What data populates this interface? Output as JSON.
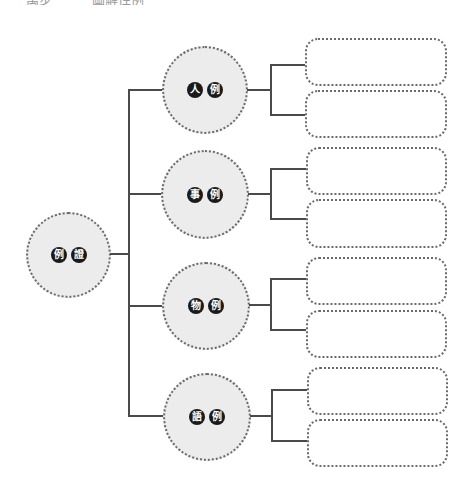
{
  "header": {
    "left_fragment": "萬步",
    "right_fragment": "圖解性例"
  },
  "root": {
    "chars": [
      "例",
      "證"
    ]
  },
  "branches": [
    {
      "chars": [
        "人",
        "例"
      ],
      "boxes": [
        "",
        ""
      ]
    },
    {
      "chars": [
        "事",
        "例"
      ],
      "boxes": [
        "",
        ""
      ]
    },
    {
      "chars": [
        "物",
        "例"
      ],
      "boxes": [
        "",
        ""
      ]
    },
    {
      "chars": [
        "語",
        "例"
      ],
      "boxes": [
        "",
        ""
      ]
    }
  ],
  "colors": {
    "line": "#4a4a4a",
    "circle_fill": "#ececec",
    "dotted_border": "#6a6a6a",
    "badge": "#1a1a1a"
  }
}
